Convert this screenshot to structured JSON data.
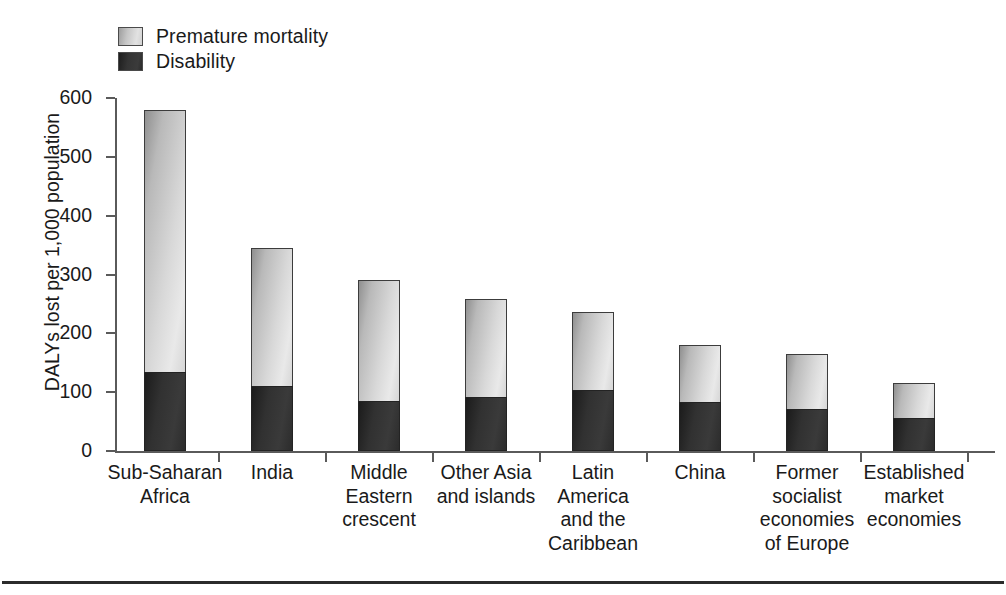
{
  "chart_data": {
    "type": "bar",
    "subtype": "stacked-vertical",
    "title": "",
    "xlabel": "",
    "ylabel": "DALYs lost per 1,000 population",
    "ylim": [
      0,
      600
    ],
    "yticks": [
      0,
      100,
      200,
      300,
      400,
      500,
      600
    ],
    "ytick_labels": [
      "0",
      "100",
      "200",
      "300",
      "400",
      "500",
      "600"
    ],
    "grid": false,
    "legend_position": "top-left",
    "categories": [
      "Sub-Saharan\nAfrica",
      "India",
      "Middle\nEastern\ncrescent",
      "Other Asia\nand islands",
      "Latin\nAmerica\nand the\nCaribbean",
      "China",
      "Former\nsocialist\neconomies\nof Europe",
      "Established\nmarket\neconomies"
    ],
    "series": [
      {
        "name": "Disability",
        "color": "#303030",
        "values": [
          135,
          110,
          85,
          91,
          103,
          83,
          72,
          56
        ]
      },
      {
        "name": "Premature mortality",
        "color": "#d2d2d2",
        "values": [
          445,
          235,
          205,
          167,
          133,
          97,
          93,
          59
        ]
      }
    ],
    "totals": [
      580,
      345,
      290,
      258,
      236,
      180,
      165,
      115
    ]
  },
  "legend": {
    "items": [
      {
        "label": "Premature mortality",
        "swatch": "premature"
      },
      {
        "label": "Disability",
        "swatch": "disability"
      }
    ]
  },
  "axes": {
    "y_title": "DALYs lost per 1,000 population"
  }
}
